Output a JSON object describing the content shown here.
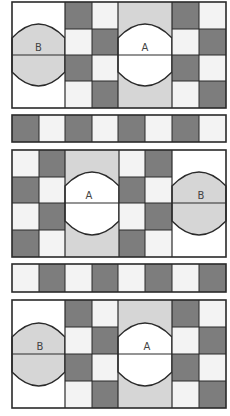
{
  "colors": {
    "dark": "#7d7d7d",
    "light": "#f3f3f3",
    "medium": "#d6d6d6",
    "white": "#ffffff",
    "line": "#2a2a2a"
  },
  "panels": [
    {
      "id": "panel-1",
      "order": [
        "B",
        "checker",
        "A",
        "checker"
      ],
      "labels": {
        "A": "A",
        "B": "B"
      }
    },
    {
      "id": "panel-2",
      "order": [
        "checker",
        "A",
        "checker",
        "B"
      ],
      "labels": {
        "A": "A",
        "B": "B"
      }
    },
    {
      "id": "panel-3",
      "order": [
        "B",
        "checker",
        "A",
        "checker"
      ],
      "labels": {
        "A": "A",
        "B": "B"
      }
    }
  ],
  "strips": [
    {
      "id": "strip-1",
      "pattern": [
        "dark",
        "light",
        "dark",
        "light",
        "dark",
        "light",
        "dark",
        "light"
      ]
    },
    {
      "id": "strip-2",
      "pattern": [
        "light",
        "dark",
        "light",
        "dark",
        "light",
        "dark",
        "light",
        "dark"
      ]
    }
  ],
  "labels": {
    "p1_b": "B",
    "p1_a": "A",
    "p2_a": "A",
    "p2_b": "B",
    "p3_b": "B",
    "p3_a": "A"
  }
}
